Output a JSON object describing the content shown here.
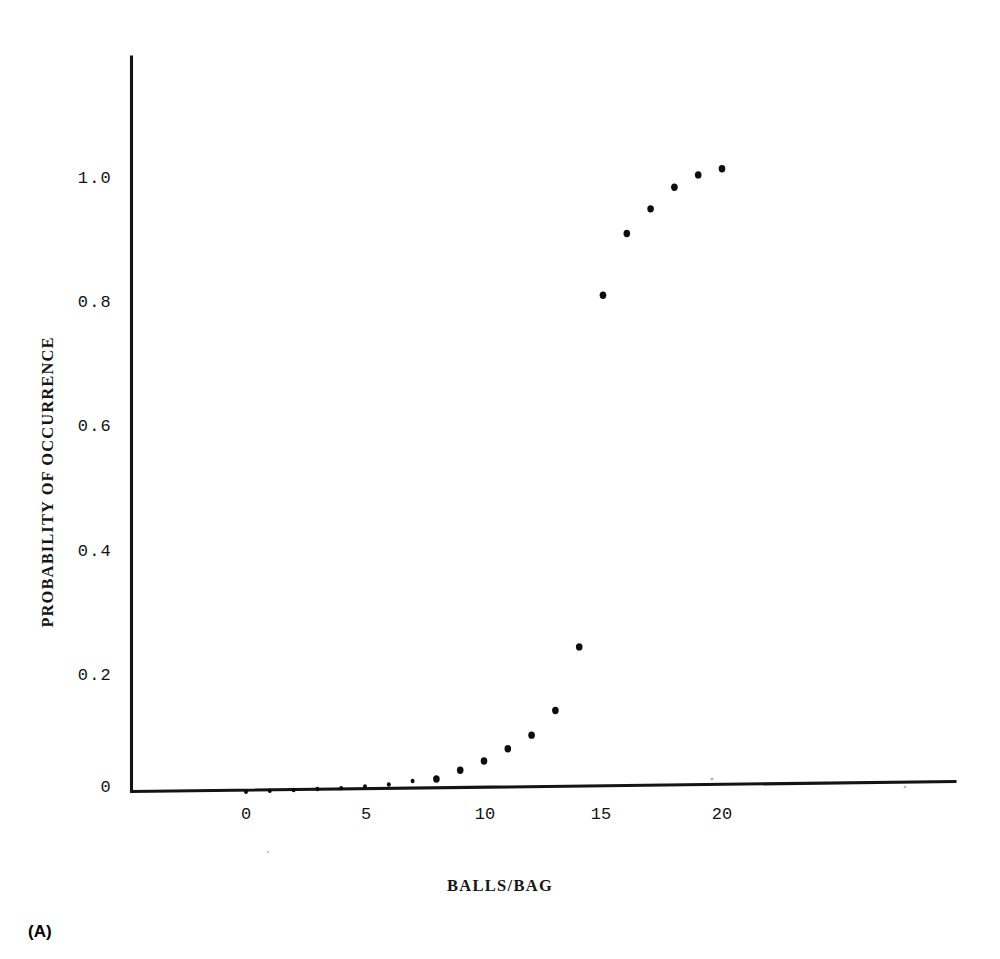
{
  "figure": {
    "caption": "(A)",
    "background_color": "#ffffff",
    "ink_color": "#121212"
  },
  "chart_data": {
    "type": "scatter",
    "title": "",
    "xlabel": "BALLS/BAG",
    "ylabel": "PROBABILITY OF OCCURRENCE",
    "x_ticks": [
      "0",
      "5",
      "10",
      "15",
      "20"
    ],
    "x_tick_values": [
      0,
      5,
      10,
      15,
      20
    ],
    "y_ticks": [
      "0",
      "0.2",
      "0.4",
      "0.6",
      "0.8",
      "1.0"
    ],
    "y_tick_values": [
      0,
      0.2,
      0.4,
      0.6,
      0.8,
      1.0
    ],
    "xlim": [
      -4,
      28
    ],
    "ylim": [
      0,
      1.18
    ],
    "grid": false,
    "legend": "none",
    "marker": "filled-circle",
    "x": [
      0,
      1,
      2,
      3,
      4,
      5,
      6,
      7,
      8,
      9,
      10,
      11,
      12,
      13,
      14,
      15,
      16,
      17,
      18,
      19,
      20
    ],
    "y": [
      0.003,
      0.004,
      0.005,
      0.006,
      0.007,
      0.009,
      0.012,
      0.017,
      0.026,
      0.04,
      0.055,
      0.075,
      0.097,
      0.137,
      0.24,
      0.81,
      0.91,
      0.95,
      0.985,
      1.005,
      1.015
    ],
    "series": [
      {
        "name": "Probability of occurrence",
        "values": [
          0.003,
          0.004,
          0.005,
          0.006,
          0.007,
          0.009,
          0.012,
          0.017,
          0.026,
          0.04,
          0.055,
          0.075,
          0.097,
          0.137,
          0.24,
          0.81,
          0.91,
          0.95,
          0.985,
          1.005,
          1.015
        ]
      }
    ]
  }
}
